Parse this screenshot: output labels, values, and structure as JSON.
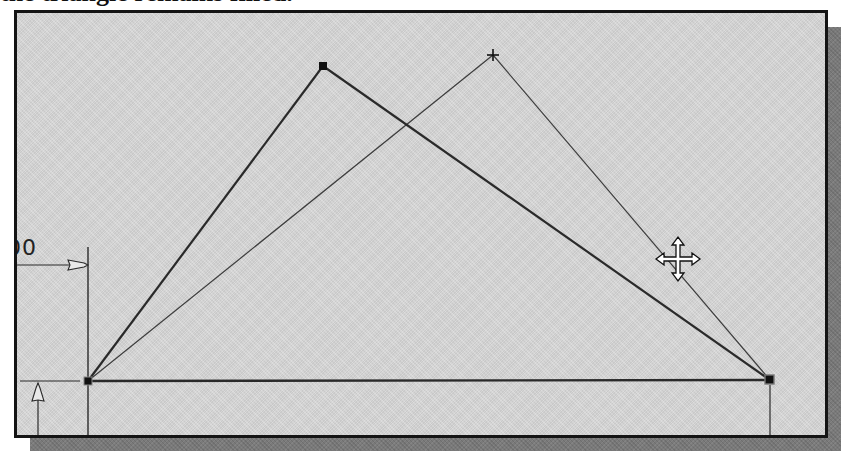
{
  "caption": {
    "text": "the triangle remains filled."
  },
  "viewport": {
    "background": "#d4d4d4",
    "border_color": "#141414",
    "shadow_color": "#7a7a7a"
  },
  "sketch": {
    "original_triangle": {
      "vertices": [
        {
          "name": "bottom-left",
          "x": 88,
          "y": 381
        },
        {
          "name": "apex",
          "x": 323,
          "y": 66
        },
        {
          "name": "bottom-right",
          "x": 770,
          "y": 380
        }
      ],
      "stroke": "#2a2a2a",
      "stroke_width": 2.2
    },
    "dragged_triangle": {
      "vertices": [
        {
          "name": "bottom-left",
          "x": 88,
          "y": 381
        },
        {
          "name": "apex",
          "x": 493,
          "y": 55
        },
        {
          "name": "bottom-right",
          "x": 770,
          "y": 380
        }
      ],
      "stroke": "#3c3c3c",
      "stroke_width": 1.2
    },
    "dimension_label_partial": "00"
  },
  "cursor": {
    "icon": "move-cursor-icon",
    "x": 678,
    "y": 259
  }
}
